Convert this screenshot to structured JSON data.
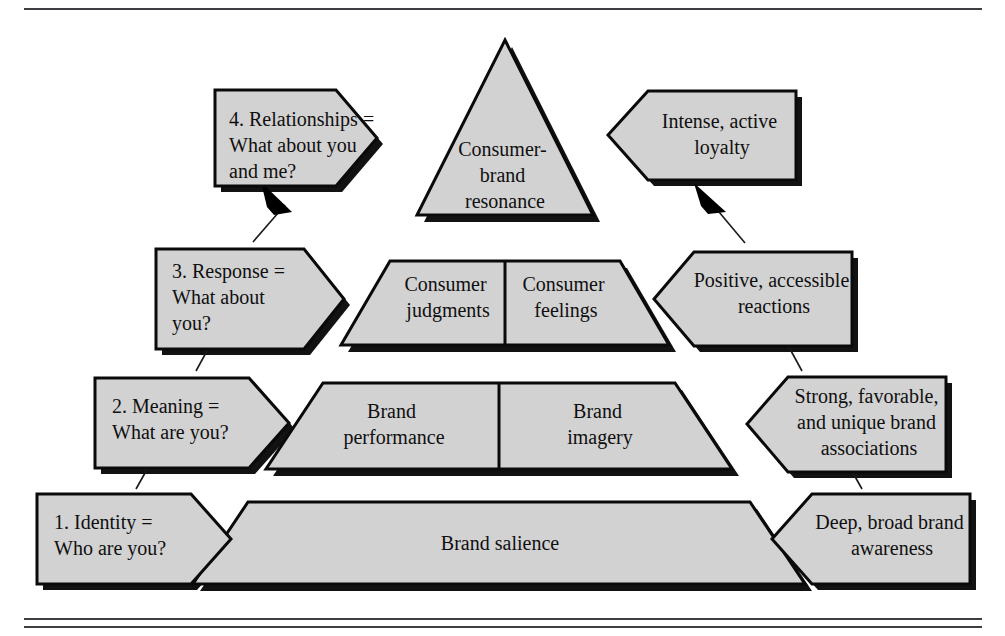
{
  "figure": {
    "title_visible": false,
    "colors": {
      "shape_fill": "#d2d2d2",
      "shape_stroke": "#0a0a0a",
      "shadow": "#121212",
      "rule": "#3d3d44",
      "background": "#ffffff",
      "text": "#100f10"
    }
  },
  "pyramid": {
    "apex": {
      "name": "consumer-brand-resonance",
      "lines": [
        "Consumer-",
        "brand",
        "resonance"
      ]
    },
    "tier_response": {
      "left": {
        "lines": [
          "Consumer",
          "judgments"
        ]
      },
      "right": {
        "lines": [
          "Consumer",
          "feelings"
        ]
      }
    },
    "tier_meaning": {
      "left": {
        "lines": [
          "Brand",
          "performance"
        ]
      },
      "right": {
        "lines": [
          "Brand",
          "imagery"
        ]
      }
    },
    "tier_identity": {
      "center": {
        "lines": [
          "Brand salience"
        ]
      }
    }
  },
  "left_labels": [
    {
      "key": "identity",
      "number": "1.",
      "lines": [
        "Identity =",
        "Who are you?"
      ],
      "line1_with_number": "1.   Identity ="
    },
    {
      "key": "meaning",
      "number": "2.",
      "lines": [
        "Meaning =",
        "What are you?"
      ],
      "line1_with_number": "2.   Meaning ="
    },
    {
      "key": "response",
      "number": "3.",
      "lines": [
        "Response =",
        "What about",
        "you?"
      ],
      "line1_with_number": "3.   Response ="
    },
    {
      "key": "relationships",
      "number": "4.",
      "lines": [
        "Relationships =",
        "What about you",
        "and me?"
      ],
      "line1_with_number": "4.   Relationships ="
    }
  ],
  "right_labels": [
    {
      "key": "awareness",
      "lines": [
        "Deep, broad brand",
        "awareness"
      ]
    },
    {
      "key": "associations",
      "lines": [
        "Strong, favorable,",
        "and unique brand",
        "associations"
      ]
    },
    {
      "key": "reactions",
      "lines": [
        "Positive, accessible",
        "reactions"
      ]
    },
    {
      "key": "loyalty",
      "lines": [
        "Intense, active",
        "loyalty"
      ]
    }
  ]
}
